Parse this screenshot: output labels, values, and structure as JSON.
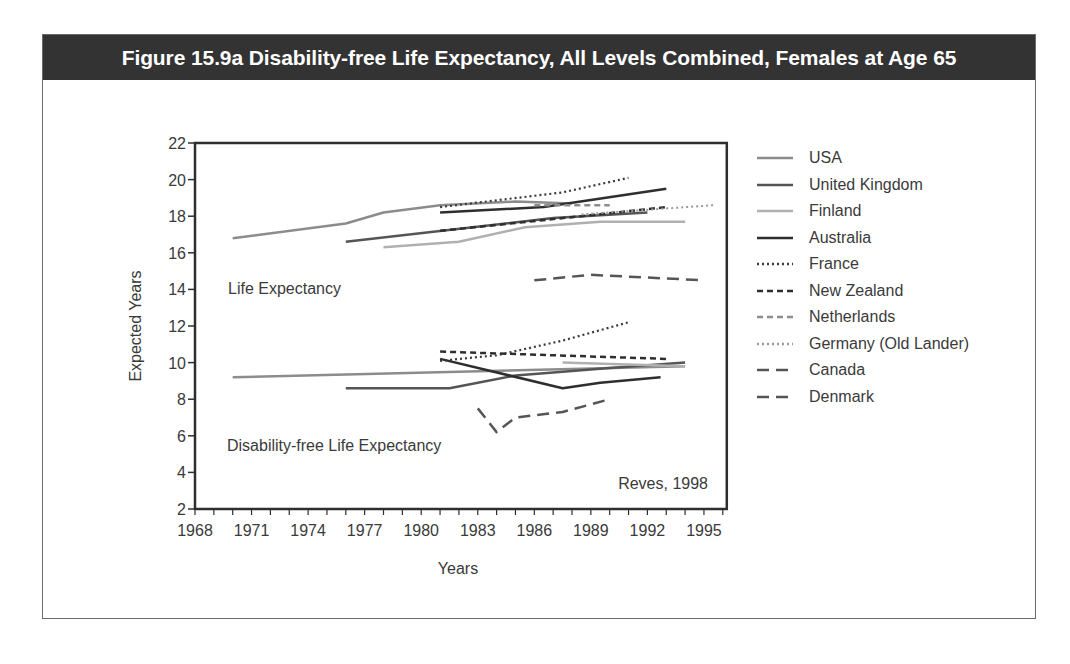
{
  "figure": {
    "title": "Figure 15.9a Disability-free Life Expectancy, All Levels Combined, Females at Age 65",
    "source_note": "Reves, 1998",
    "annotations": {
      "upper": "Life Expectancy",
      "lower": "Disability-free Life Expectancy"
    }
  },
  "chart_data": {
    "type": "line",
    "title": "Figure 15.9a Disability-free Life Expectancy, All Levels Combined, Females at Age 65",
    "xlabel": "Years",
    "ylabel": "Expected Years",
    "xlim": [
      1968,
      1996
    ],
    "ylim": [
      2,
      22
    ],
    "x_ticks": [
      1968,
      1971,
      1974,
      1977,
      1980,
      1983,
      1986,
      1989,
      1992,
      1995
    ],
    "y_ticks": [
      2,
      4,
      6,
      8,
      10,
      12,
      14,
      16,
      18,
      20,
      22
    ],
    "grid": false,
    "legend_position": "right",
    "annotations": [
      "Life Expectancy",
      "Disability-free Life Expectancy",
      "Reves, 1998"
    ],
    "series": [
      {
        "name": "USA",
        "style": "solid",
        "color": "#8c8c8c",
        "width": 2.5,
        "life_expectancy": [
          [
            1970,
            16.8
          ],
          [
            1976,
            17.6
          ],
          [
            1978,
            18.2
          ],
          [
            1981,
            18.6
          ],
          [
            1985,
            18.8
          ],
          [
            1988,
            18.7
          ]
        ],
        "disability_free": [
          [
            1970,
            9.2
          ],
          [
            1994,
            9.8
          ]
        ]
      },
      {
        "name": "United Kingdom",
        "style": "solid",
        "color": "#555555",
        "width": 2.5,
        "life_expectancy": [
          [
            1976,
            16.6
          ],
          [
            1987,
            17.9
          ],
          [
            1992,
            18.2
          ]
        ],
        "disability_free": [
          [
            1976,
            8.6
          ],
          [
            1981.5,
            8.6
          ],
          [
            1985,
            9.3
          ],
          [
            1990,
            9.7
          ],
          [
            1994,
            10.0
          ]
        ]
      },
      {
        "name": "Finland",
        "style": "solid",
        "color": "#b0b0b0",
        "width": 2.5,
        "life_expectancy": [
          [
            1978,
            16.3
          ],
          [
            1982,
            16.6
          ],
          [
            1985.5,
            17.4
          ],
          [
            1989.5,
            17.7
          ],
          [
            1994,
            17.7
          ]
        ],
        "disability_free": [
          [
            1987.5,
            10.0
          ],
          [
            1994,
            9.8
          ]
        ]
      },
      {
        "name": "Australia",
        "style": "solid",
        "color": "#2e2e2e",
        "width": 2.5,
        "life_expectancy": [
          [
            1981,
            18.2
          ],
          [
            1986.5,
            18.5
          ],
          [
            1993,
            19.5
          ]
        ],
        "disability_free": [
          [
            1981,
            10.2
          ],
          [
            1987.5,
            8.6
          ],
          [
            1989.5,
            8.9
          ],
          [
            1992.7,
            9.2
          ]
        ]
      },
      {
        "name": "France",
        "style": "dotted",
        "color": "#3a3a3a",
        "width": 2.2,
        "life_expectancy": [
          [
            1981,
            18.5
          ],
          [
            1987.5,
            19.3
          ],
          [
            1991,
            20.1
          ]
        ],
        "disability_free": [
          [
            1981,
            10.1
          ],
          [
            1984,
            10.4
          ],
          [
            1987.5,
            11.2
          ],
          [
            1991,
            12.2
          ]
        ]
      },
      {
        "name": "New Zealand",
        "style": "dashed",
        "color": "#2e2e2e",
        "width": 2.5,
        "life_expectancy": [
          [
            1981,
            17.2
          ],
          [
            1988.5,
            18.0
          ],
          [
            1993,
            18.5
          ]
        ],
        "disability_free": [
          [
            1981,
            10.6
          ],
          [
            1993,
            10.2
          ]
        ]
      },
      {
        "name": "Netherlands",
        "style": "dashed",
        "color": "#8c8c8c",
        "width": 2.5,
        "life_expectancy": [
          [
            1986,
            18.6
          ],
          [
            1990,
            18.6
          ]
        ],
        "disability_free": []
      },
      {
        "name": "Germany (Old Lander)",
        "style": "dotted",
        "color": "#9a9a9a",
        "width": 2,
        "life_expectancy": [
          [
            1988.5,
            18.1
          ],
          [
            1995.5,
            18.6
          ]
        ],
        "disability_free": []
      },
      {
        "name": "Canada",
        "style": "long-dashed",
        "color": "#555555",
        "width": 2.5,
        "life_expectancy": [
          [
            1986,
            14.5
          ],
          [
            1989,
            14.8
          ],
          [
            1995,
            14.5
          ]
        ],
        "disability_free": []
      },
      {
        "name": "Denmark",
        "style": "long-dashed",
        "color": "#555555",
        "width": 2.5,
        "life_expectancy": [],
        "disability_free": [
          [
            1983,
            7.5
          ],
          [
            1984,
            6.2
          ],
          [
            1985,
            7.0
          ],
          [
            1987.5,
            7.3
          ],
          [
            1990,
            8.0
          ]
        ]
      }
    ]
  },
  "legend": {
    "items": [
      {
        "label": "USA",
        "style": "solid",
        "color": "#8c8c8c"
      },
      {
        "label": "United Kingdom",
        "style": "solid",
        "color": "#555555"
      },
      {
        "label": "Finland",
        "style": "solid",
        "color": "#b0b0b0"
      },
      {
        "label": "Australia",
        "style": "solid",
        "color": "#2e2e2e"
      },
      {
        "label": "France",
        "style": "dotted",
        "color": "#3a3a3a"
      },
      {
        "label": "New Zealand",
        "style": "dashed",
        "color": "#2e2e2e"
      },
      {
        "label": "Netherlands",
        "style": "dashed",
        "color": "#8c8c8c"
      },
      {
        "label": "Germany (Old Lander)",
        "style": "dotted",
        "color": "#9a9a9a"
      },
      {
        "label": "Canada",
        "style": "long-dashed",
        "color": "#555555"
      },
      {
        "label": "Denmark",
        "style": "long-dashed",
        "color": "#555555"
      }
    ]
  }
}
